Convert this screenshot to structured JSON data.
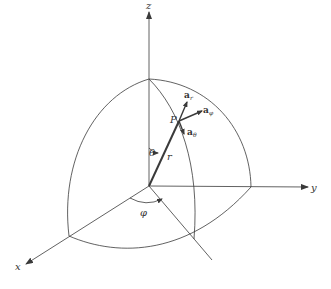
{
  "figure": {
    "type": "spherical-coordinate-system",
    "axes": {
      "x": {
        "label": "x"
      },
      "y": {
        "label": "y"
      },
      "z": {
        "label": "z"
      }
    },
    "point": {
      "label": "P"
    },
    "radius": {
      "label": "r"
    },
    "angles": {
      "theta": {
        "label": "θ"
      },
      "phi": {
        "label": "φ"
      }
    },
    "unit_vectors": [
      {
        "base": "a",
        "subscript": "r"
      },
      {
        "base": "a",
        "subscript": "φ"
      },
      {
        "base": "a",
        "subscript": "θ"
      }
    ],
    "colors": {
      "line": "#3a3a3a",
      "background": "#ffffff"
    }
  }
}
